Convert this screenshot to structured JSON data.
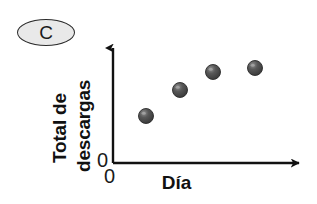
{
  "panel": {
    "letter": "C"
  },
  "colors": {
    "axis": "#111111",
    "marker_fill": "#4a4a4a",
    "marker_edge": "#2a2a2a",
    "marker_highlight": "#9a9a9a",
    "badge_fill": "#e9e9e9",
    "badge_edge": "#2b2b2b",
    "text": "#111111",
    "background": "#ffffff"
  },
  "chart_data": {
    "type": "scatter",
    "title": "",
    "xlabel": "Día",
    "ylabel_lines": [
      "Total de",
      "descargas"
    ],
    "ylabel": "Total de descargas",
    "xtick_labels": [
      "0"
    ],
    "ytick_labels": [
      "0"
    ],
    "grid": false,
    "legend": null,
    "xlim": [
      0,
      5
    ],
    "ylim": [
      0,
      5
    ],
    "x": [
      1,
      2,
      3,
      4
    ],
    "y": [
      1.55,
      2.6,
      3.2,
      3.45
    ],
    "points": [
      {
        "x": 1,
        "y": 1.55,
        "px": 146,
        "py": 116
      },
      {
        "x": 2,
        "y": 2.6,
        "px": 180,
        "py": 90
      },
      {
        "x": 3,
        "y": 3.2,
        "px": 213,
        "py": 72
      },
      {
        "x": 4,
        "y": 3.45,
        "px": 255,
        "py": 68
      }
    ],
    "axes_geometry": {
      "origin_px": [
        113,
        163
      ],
      "y_axis_top_px": 42,
      "x_axis_right_px": 305,
      "marker_radius_px": 7.5
    }
  }
}
